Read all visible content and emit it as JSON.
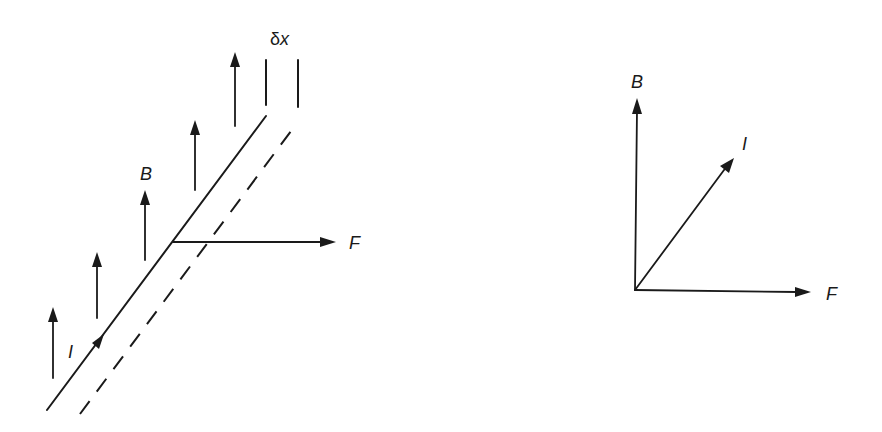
{
  "figure": {
    "left_diagram": {
      "labels": {
        "field": "B",
        "current": "I",
        "force": "F",
        "displacement_delta": "δ",
        "displacement_var": "x"
      }
    },
    "right_diagram": {
      "labels": {
        "field": "B",
        "current": "I",
        "force": "F"
      }
    }
  },
  "colors": {
    "ink": "#1a1a1a",
    "background": "#ffffff"
  }
}
